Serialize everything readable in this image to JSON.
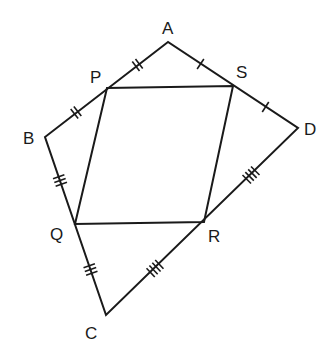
{
  "diagram": {
    "type": "geometry",
    "stroke_color": "#1a1a1a",
    "background": "#ffffff",
    "vertices": {
      "A": {
        "label": "A",
        "x": 168,
        "y": 42
      },
      "B": {
        "label": "B",
        "x": 45,
        "y": 137
      },
      "C": {
        "label": "C",
        "x": 106,
        "y": 315
      },
      "D": {
        "label": "D",
        "x": 298,
        "y": 128
      },
      "P": {
        "label": "P",
        "x": 107,
        "y": 88
      },
      "Q": {
        "label": "Q",
        "x": 75,
        "y": 224
      },
      "R": {
        "label": "R",
        "x": 204,
        "y": 222
      },
      "S": {
        "label": "S",
        "x": 233,
        "y": 86
      }
    },
    "outer_quadrilateral": [
      "A",
      "B",
      "C",
      "D"
    ],
    "inner_parallelogram": [
      "P",
      "Q",
      "R",
      "S"
    ],
    "tick_marks": [
      {
        "segment": "AP",
        "count": 2
      },
      {
        "segment": "PB",
        "count": 2
      },
      {
        "segment": "BQ",
        "count": 3
      },
      {
        "segment": "QC",
        "count": 3
      },
      {
        "segment": "CR",
        "count": 4
      },
      {
        "segment": "RD",
        "count": 4
      },
      {
        "segment": "DS",
        "count": 1
      },
      {
        "segment": "SA",
        "count": 1
      }
    ]
  }
}
